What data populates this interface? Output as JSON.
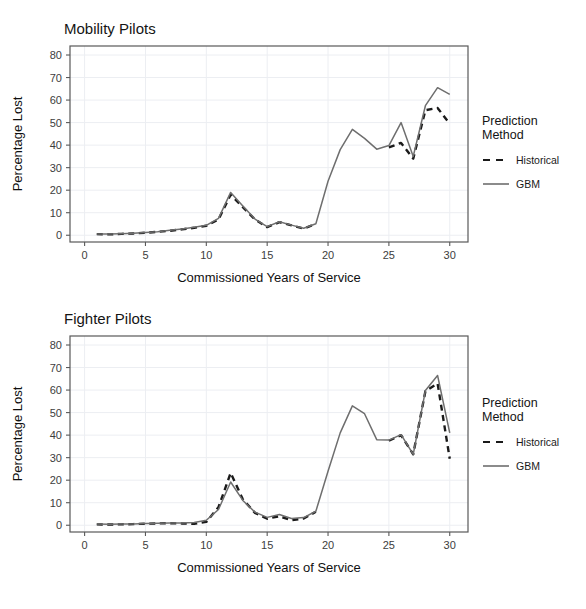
{
  "page": {
    "cropped_top_text": "",
    "background": "#ffffff",
    "ink": "#333333"
  },
  "legend": {
    "title_line1": "Prediction",
    "title_line2": "Method",
    "items": [
      {
        "label": "Historical",
        "style": "dashed",
        "color": "#1a1a1a"
      },
      {
        "label": "GBM",
        "style": "solid",
        "color": "#6e6e6e"
      }
    ]
  },
  "axes": {
    "xlabel": "Commissioned Years of Service",
    "ylabel": "Percentage Lost",
    "xticks": [
      0,
      5,
      10,
      15,
      20,
      25,
      30
    ],
    "yticks": [
      0,
      10,
      20,
      30,
      40,
      50,
      60,
      70,
      80
    ],
    "xlim": [
      -1.2,
      31.5
    ],
    "ylim": [
      -3,
      84
    ]
  },
  "chart_data": [
    {
      "type": "line",
      "title": "Mobility Pilots",
      "xlabel": "Commissioned Years of Service",
      "ylabel": "Percentage Lost",
      "xlim": [
        -1.2,
        31.5
      ],
      "ylim": [
        -3,
        84
      ],
      "xticks": [
        0,
        5,
        10,
        15,
        20,
        25,
        30
      ],
      "yticks": [
        0,
        10,
        20,
        30,
        40,
        50,
        60,
        70,
        80
      ],
      "grid": true,
      "legend_position": "right",
      "x": [
        1,
        2,
        3,
        4,
        5,
        6,
        7,
        8,
        9,
        10,
        11,
        12,
        13,
        14,
        15,
        16,
        17,
        18,
        19,
        20,
        21,
        22,
        23,
        24,
        25,
        26,
        27,
        28,
        29,
        30
      ],
      "series": [
        {
          "name": "Historical",
          "style": "dashed",
          "color": "#1a1a1a",
          "values": [
            0.5,
            0.4,
            0.6,
            0.8,
            1.1,
            1.5,
            2.0,
            2.6,
            3.3,
            4.2,
            7.0,
            18.0,
            12.5,
            7.0,
            3.6,
            5.8,
            4.4,
            3.0,
            5.0,
            null,
            null,
            null,
            null,
            null,
            39.0,
            41.0,
            34.0,
            55.5,
            56.5,
            49.5
          ]
        },
        {
          "name": "GBM",
          "style": "solid",
          "color": "#6e6e6e",
          "values": [
            0.6,
            0.5,
            0.7,
            0.9,
            1.2,
            1.6,
            2.2,
            2.8,
            3.5,
            4.4,
            7.5,
            19.0,
            13.0,
            7.2,
            3.8,
            6.0,
            4.5,
            3.1,
            5.1,
            24.0,
            38.0,
            47.0,
            43.0,
            38.2,
            39.8,
            50.0,
            35.0,
            57.5,
            65.5,
            62.5
          ]
        }
      ]
    },
    {
      "type": "line",
      "title": "Fighter Pilots",
      "xlabel": "Commissioned Years of Service",
      "ylabel": "Percentage Lost",
      "xlim": [
        -1.2,
        31.5
      ],
      "ylim": [
        -3,
        84
      ],
      "xticks": [
        0,
        5,
        10,
        15,
        20,
        25,
        30
      ],
      "yticks": [
        0,
        10,
        20,
        30,
        40,
        50,
        60,
        70,
        80
      ],
      "grid": true,
      "legend_position": "right",
      "x": [
        1,
        2,
        3,
        4,
        5,
        6,
        7,
        8,
        9,
        10,
        11,
        12,
        13,
        14,
        15,
        16,
        17,
        18,
        19,
        20,
        21,
        22,
        23,
        24,
        25,
        26,
        27,
        28,
        29,
        30
      ],
      "series": [
        {
          "name": "Historical",
          "style": "dashed",
          "color": "#1a1a1a",
          "values": [
            0.4,
            0.3,
            0.4,
            0.5,
            0.7,
            0.8,
            0.9,
            0.8,
            0.6,
            1.5,
            8.0,
            23.2,
            11.5,
            5.5,
            2.9,
            4.0,
            2.2,
            3.0,
            6.0,
            null,
            null,
            null,
            null,
            null,
            37.5,
            40.0,
            31.5,
            59.5,
            63.0,
            29.5
          ]
        },
        {
          "name": "GBM",
          "style": "solid",
          "color": "#6e6e6e",
          "values": [
            0.5,
            0.4,
            0.5,
            0.6,
            0.8,
            0.9,
            1.0,
            1.0,
            1.2,
            2.2,
            7.0,
            19.2,
            11.0,
            5.8,
            3.5,
            4.8,
            3.0,
            3.4,
            6.2,
            24.0,
            41.0,
            53.0,
            49.5,
            38.0,
            37.8,
            40.2,
            31.5,
            59.8,
            66.5,
            41.0
          ]
        }
      ]
    }
  ]
}
